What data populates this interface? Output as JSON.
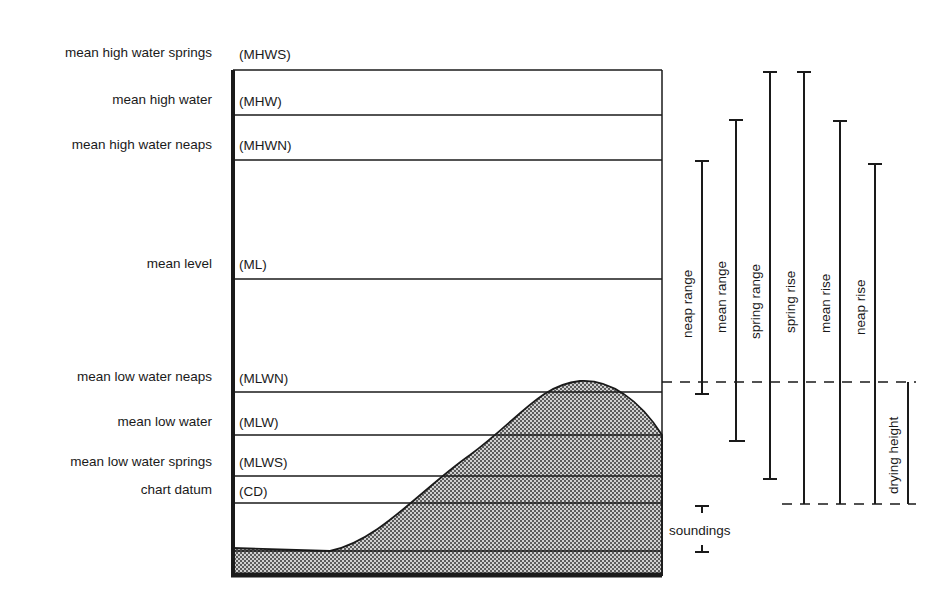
{
  "levels": [
    {
      "key": "mhws",
      "name": "mean high water springs",
      "abbr": "(MHWS)"
    },
    {
      "key": "mhw",
      "name": "mean high water",
      "abbr": "(MHW)"
    },
    {
      "key": "mhwn",
      "name": "mean high water neaps",
      "abbr": "(MHWN)"
    },
    {
      "key": "ml",
      "name": "mean level",
      "abbr": "(ML)"
    },
    {
      "key": "mlwn",
      "name": "mean low water neaps",
      "abbr": "(MLWN)"
    },
    {
      "key": "mlw",
      "name": "mean low water",
      "abbr": "(MLW)"
    },
    {
      "key": "mlws",
      "name": "mean low water springs",
      "abbr": "(MLWS)"
    },
    {
      "key": "cd",
      "name": "chart datum",
      "abbr": "(CD)"
    }
  ],
  "measures": [
    {
      "label": "neap range",
      "from": "MLWN",
      "to": "MHWN"
    },
    {
      "label": "mean range",
      "from": "MLW",
      "to": "MHW"
    },
    {
      "label": "spring range",
      "from": "MLWS",
      "to": "MHWS"
    },
    {
      "label": "spring rise",
      "from": "CD",
      "to": "MHWS"
    },
    {
      "label": "mean rise",
      "from": "CD",
      "to": "MHW"
    },
    {
      "label": "neap rise",
      "from": "CD",
      "to": "MHWN"
    }
  ],
  "drying_height": {
    "label": "drying height"
  },
  "soundings": {
    "label": "soundings"
  },
  "colors": {
    "ink": "#1a1a1a",
    "seabed_fill": "#b8b8b8"
  }
}
